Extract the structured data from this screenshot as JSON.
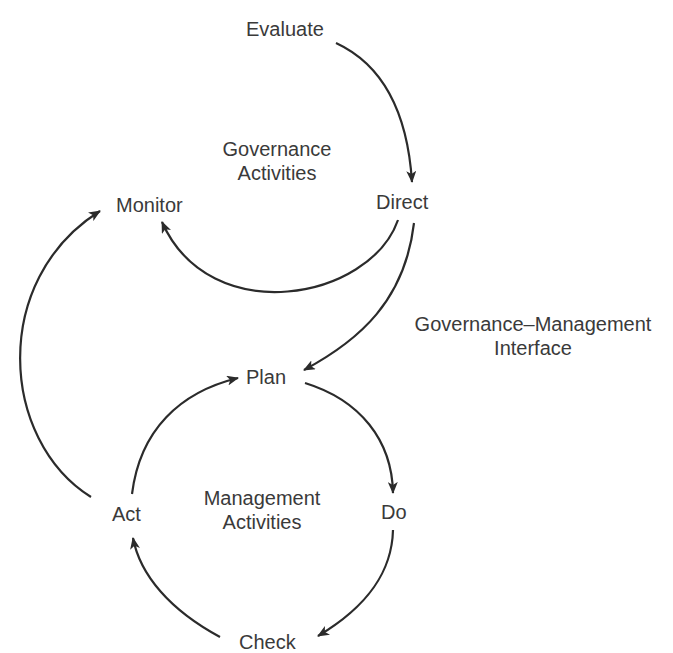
{
  "diagram": {
    "colors": {
      "stroke": "#2b2b2b",
      "text": "#3a3a3a",
      "background": "#ffffff"
    },
    "nodes": {
      "evaluate": "Evaluate",
      "direct": "Direct",
      "monitor": "Monitor",
      "plan": "Plan",
      "do": "Do",
      "check": "Check",
      "act": "Act"
    },
    "regions": {
      "governance_line1": "Governance",
      "governance_line2": "Activities",
      "interface_line1": "Governance–Management",
      "interface_line2": "Interface",
      "management_line1": "Management",
      "management_line2": "Activities"
    },
    "edges": [
      {
        "from": "Evaluate",
        "to": "Direct"
      },
      {
        "from": "Direct",
        "to": "Monitor"
      },
      {
        "from": "Direct",
        "to": "Plan"
      },
      {
        "from": "Plan",
        "to": "Do"
      },
      {
        "from": "Do",
        "to": "Check"
      },
      {
        "from": "Check",
        "to": "Act"
      },
      {
        "from": "Act",
        "to": "Plan"
      },
      {
        "from": "Act",
        "to": "Monitor"
      }
    ]
  }
}
